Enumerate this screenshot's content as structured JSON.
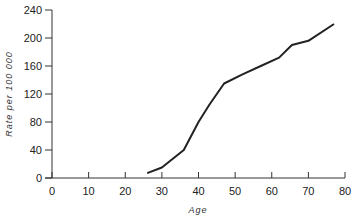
{
  "chart_data": {
    "type": "line",
    "title": "",
    "xlabel": "Age",
    "ylabel": "Rate per 100 000",
    "xlim": [
      0,
      80
    ],
    "ylim": [
      0,
      240
    ],
    "xticks": [
      0,
      10,
      20,
      30,
      40,
      50,
      60,
      70,
      80
    ],
    "yticks": [
      0,
      40,
      80,
      120,
      160,
      200,
      240
    ],
    "grid": false,
    "legend": null,
    "series": [
      {
        "name": "Rate",
        "color": "#222222",
        "x": [
          26,
          30,
          36,
          40,
          43,
          47,
          52,
          57,
          62,
          65.5,
          70,
          77
        ],
        "y": [
          7,
          15,
          40,
          80,
          105,
          135,
          148,
          160,
          172,
          190,
          196,
          220
        ]
      }
    ]
  }
}
